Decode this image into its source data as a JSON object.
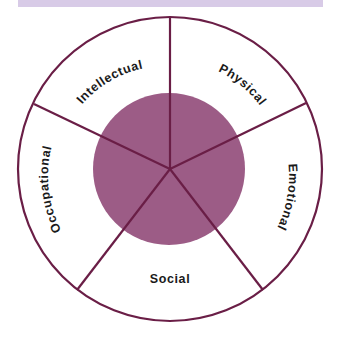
{
  "diagram": {
    "type": "wellness-wheel",
    "center_label": "",
    "segments": [
      {
        "id": "intellectual",
        "label": "Intellectual"
      },
      {
        "id": "physical",
        "label": "Physical"
      },
      {
        "id": "emotional",
        "label": "Emotional"
      },
      {
        "id": "social",
        "label": "Social"
      },
      {
        "id": "occupational",
        "label": "Occupational"
      }
    ],
    "colors": {
      "stroke": "#6a1e46",
      "inner_fill": "#9c5c86",
      "top_band": "#d8cbe7",
      "text": "#1a1a1a"
    }
  }
}
